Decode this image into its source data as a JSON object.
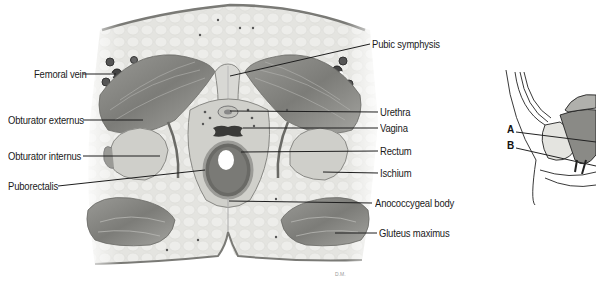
{
  "figure": {
    "signature": "D.M.",
    "labels_left": [
      {
        "id": "femoral-vein",
        "text": "Femoral vein"
      },
      {
        "id": "obturator-externus",
        "text": "Obturator externus"
      },
      {
        "id": "obturator-internus",
        "text": "Obturator internus"
      },
      {
        "id": "puborectalis",
        "text": "Puborectalis"
      }
    ],
    "labels_right": [
      {
        "id": "pubic-symphysis",
        "text": "Pubic symphysis"
      },
      {
        "id": "urethra",
        "text": "Urethra"
      },
      {
        "id": "vagina",
        "text": "Vagina"
      },
      {
        "id": "rectum",
        "text": "Rectum"
      },
      {
        "id": "ischium",
        "text": "Ischium"
      },
      {
        "id": "anococcygeal-body",
        "text": "Anococcygeal body"
      },
      {
        "id": "gluteus-maximus",
        "text": "Gluteus maximus"
      }
    ],
    "inset": {
      "description": "Sagittal orientation diagram",
      "labels": [
        {
          "id": "a",
          "text": "A"
        },
        {
          "id": "b",
          "text": "B"
        }
      ]
    },
    "colors": {
      "fat": "#e6e6e2",
      "muscle": "#8a8a86",
      "skin": "#7a7a76",
      "bone": "#cfcfca",
      "line": "#222222"
    }
  }
}
